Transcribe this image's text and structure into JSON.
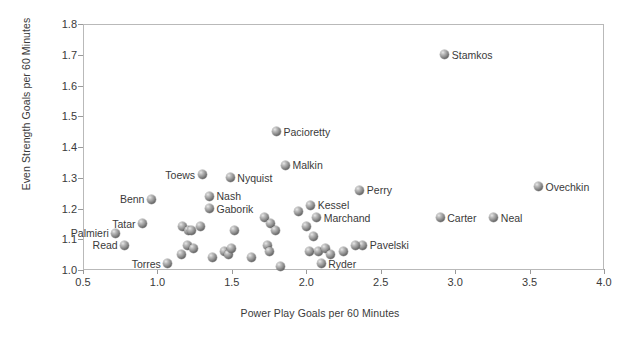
{
  "chart_data": {
    "type": "scatter",
    "title": "",
    "xlabel": "Power Play Goals per 60 Minutes",
    "ylabel": "Even Strength Goals per 60 Minutes",
    "xlim": [
      0.5,
      4.0
    ],
    "ylim": [
      1.0,
      1.8
    ],
    "xticks": [
      "0.5",
      "1.0",
      "1.5",
      "2.0",
      "2.5",
      "3.0",
      "3.5",
      "4.0"
    ],
    "yticks": [
      "1.0",
      "1.1",
      "1.2",
      "1.3",
      "1.4",
      "1.5",
      "1.6",
      "1.7",
      "1.8"
    ],
    "grid": false,
    "legend": "none",
    "marker_color": "#7a7a7a",
    "points": [
      {
        "label": "Stamkos",
        "x": 2.93,
        "y": 1.7,
        "side": "right"
      },
      {
        "label": "Pacioretty",
        "x": 1.8,
        "y": 1.45,
        "side": "right"
      },
      {
        "label": "Malkin",
        "x": 1.86,
        "y": 1.34,
        "side": "right"
      },
      {
        "label": "Toews",
        "x": 1.3,
        "y": 1.31,
        "side": "left"
      },
      {
        "label": "Nyquist",
        "x": 1.49,
        "y": 1.3,
        "side": "right"
      },
      {
        "label": "Ovechkin",
        "x": 3.56,
        "y": 1.27,
        "side": "right"
      },
      {
        "label": "Perry",
        "x": 2.36,
        "y": 1.26,
        "side": "right"
      },
      {
        "label": "Nash",
        "x": 1.35,
        "y": 1.24,
        "side": "right"
      },
      {
        "label": "Benn",
        "x": 0.96,
        "y": 1.23,
        "side": "left"
      },
      {
        "label": "Kessel",
        "x": 2.03,
        "y": 1.21,
        "side": "right"
      },
      {
        "label": "Gaborik",
        "x": 1.35,
        "y": 1.2,
        "side": "right"
      },
      {
        "label": "Marchand",
        "x": 2.07,
        "y": 1.17,
        "side": "right"
      },
      {
        "label": "Neal",
        "x": 3.26,
        "y": 1.17,
        "side": "right"
      },
      {
        "label": "Carter",
        "x": 2.9,
        "y": 1.17,
        "side": "right"
      },
      {
        "label": "Tatar",
        "x": 0.9,
        "y": 1.15,
        "side": "left"
      },
      {
        "label": "Palmieri",
        "x": 0.72,
        "y": 1.12,
        "side": "left"
      },
      {
        "label": "Pavelski",
        "x": 2.38,
        "y": 1.08,
        "side": "right"
      },
      {
        "label": "Read",
        "x": 0.78,
        "y": 1.08,
        "side": "left"
      },
      {
        "label": "Ryder",
        "x": 2.1,
        "y": 1.02,
        "side": "right"
      },
      {
        "label": "Torres",
        "x": 1.07,
        "y": 1.02,
        "side": "left"
      },
      {
        "label": "",
        "x": 1.17,
        "y": 1.14,
        "side": "right"
      },
      {
        "label": "",
        "x": 1.21,
        "y": 1.13,
        "side": "right"
      },
      {
        "label": "",
        "x": 1.23,
        "y": 1.13,
        "side": "right"
      },
      {
        "label": "",
        "x": 1.29,
        "y": 1.14,
        "side": "right"
      },
      {
        "label": "",
        "x": 1.2,
        "y": 1.08,
        "side": "right"
      },
      {
        "label": "",
        "x": 1.24,
        "y": 1.07,
        "side": "right"
      },
      {
        "label": "",
        "x": 1.16,
        "y": 1.05,
        "side": "right"
      },
      {
        "label": "",
        "x": 1.37,
        "y": 1.04,
        "side": "right"
      },
      {
        "label": "",
        "x": 1.45,
        "y": 1.06,
        "side": "right"
      },
      {
        "label": "",
        "x": 1.48,
        "y": 1.05,
        "side": "right"
      },
      {
        "label": "",
        "x": 1.52,
        "y": 1.13,
        "side": "right"
      },
      {
        "label": "",
        "x": 1.5,
        "y": 1.07,
        "side": "right"
      },
      {
        "label": "",
        "x": 1.63,
        "y": 1.04,
        "side": "right"
      },
      {
        "label": "",
        "x": 1.72,
        "y": 1.17,
        "side": "right"
      },
      {
        "label": "",
        "x": 1.76,
        "y": 1.15,
        "side": "right"
      },
      {
        "label": "",
        "x": 1.79,
        "y": 1.13,
        "side": "right"
      },
      {
        "label": "",
        "x": 1.74,
        "y": 1.08,
        "side": "right"
      },
      {
        "label": "",
        "x": 1.75,
        "y": 1.06,
        "side": "right"
      },
      {
        "label": "",
        "x": 1.83,
        "y": 1.01,
        "side": "right"
      },
      {
        "label": "",
        "x": 1.95,
        "y": 1.19,
        "side": "right"
      },
      {
        "label": "",
        "x": 2.0,
        "y": 1.14,
        "side": "right"
      },
      {
        "label": "",
        "x": 2.05,
        "y": 1.11,
        "side": "right"
      },
      {
        "label": "",
        "x": 2.02,
        "y": 1.06,
        "side": "right"
      },
      {
        "label": "",
        "x": 2.08,
        "y": 1.06,
        "side": "right"
      },
      {
        "label": "",
        "x": 2.13,
        "y": 1.07,
        "side": "right"
      },
      {
        "label": "",
        "x": 2.16,
        "y": 1.05,
        "side": "right"
      },
      {
        "label": "",
        "x": 2.25,
        "y": 1.06,
        "side": "right"
      },
      {
        "label": "",
        "x": 2.33,
        "y": 1.08,
        "side": "right"
      }
    ]
  }
}
